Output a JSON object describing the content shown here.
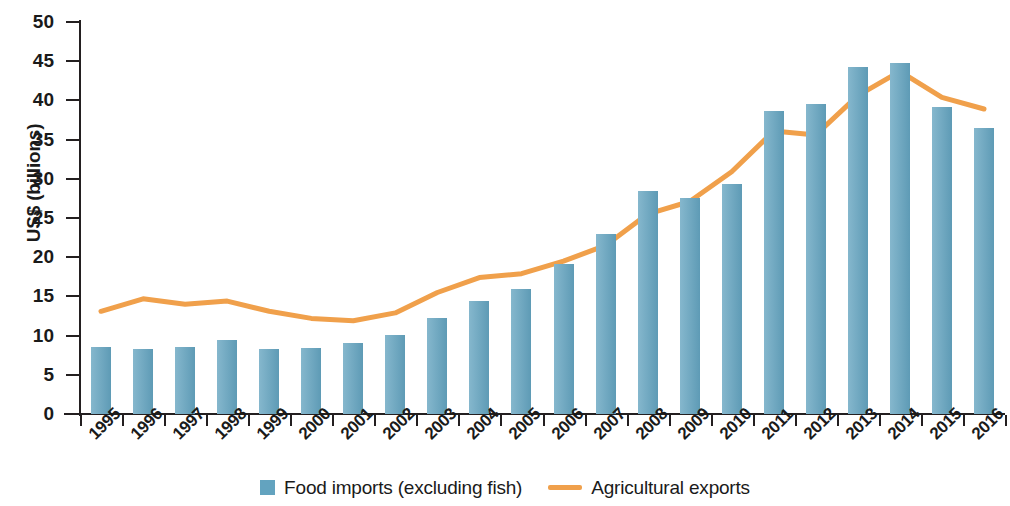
{
  "chart_data": {
    "type": "bar",
    "title": "",
    "subtitle": "",
    "xlabel": "",
    "ylabel": "US$ (billions)",
    "ylim": [
      0,
      50
    ],
    "ytick_step": 5,
    "yticks": [
      0,
      5,
      10,
      15,
      20,
      25,
      30,
      35,
      40,
      45,
      50
    ],
    "grid": false,
    "legend_position": "bottom-center",
    "categories": [
      "1995",
      "1996",
      "1997",
      "1998",
      "1999",
      "12000",
      "2001",
      "2002",
      "2003",
      "2004",
      "2005",
      "2006",
      "2007",
      "2008",
      "2009",
      "2010",
      "2011",
      "2012",
      "2013",
      "2014",
      "2015",
      "2016"
    ],
    "xtick_labels": [
      "1995",
      "1996",
      "1997",
      "1998",
      "1999",
      "2000",
      "2001",
      "2002",
      "2003",
      "2004",
      "2005",
      "2006",
      "2007",
      "2008",
      "2009",
      "2010",
      "2011",
      "2012",
      "2013",
      "2014",
      "2015",
      "2016"
    ],
    "series": [
      {
        "name": "Food imports (excluding fish)",
        "type": "bar",
        "color": "#63a3bf",
        "values": [
          8.5,
          8.3,
          8.6,
          9.4,
          8.3,
          8.4,
          9.1,
          10.1,
          12.2,
          14.4,
          16.0,
          19.1,
          22.9,
          28.4,
          27.6,
          29.4,
          38.6,
          39.6,
          44.2,
          44.8,
          39.1,
          36.5
        ]
      },
      {
        "name": "Agricultural exports",
        "type": "line",
        "color": "#f0a04b",
        "values": [
          13.1,
          14.7,
          14.0,
          14.4,
          13.1,
          12.2,
          11.9,
          12.9,
          15.5,
          17.4,
          17.9,
          19.5,
          21.5,
          25.5,
          27.1,
          30.9,
          36.1,
          35.6,
          40.6,
          43.7,
          40.4,
          38.9
        ]
      }
    ]
  },
  "legend": {
    "items": [
      {
        "label": "Food imports (excluding fish)",
        "marker": "square-swatch",
        "color": "#63a3bf"
      },
      {
        "label": "Agricultural exports",
        "marker": "line-swatch",
        "color": "#f0a04b"
      }
    ]
  }
}
